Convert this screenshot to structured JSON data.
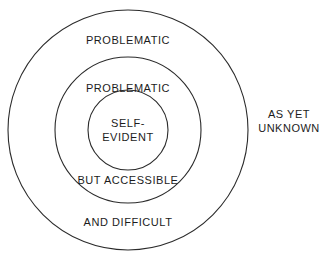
{
  "diagram": {
    "type": "concentric-circles",
    "background_color": "#ffffff",
    "stroke_color": "#2b2b2b",
    "text_color": "#1c1c1c",
    "canvas": {
      "width": 324,
      "height": 273
    },
    "circles": [
      {
        "name": "outer-circle",
        "cx": 128,
        "cy": 130,
        "r": 120
      },
      {
        "name": "middle-circle",
        "cx": 128,
        "cy": 130,
        "r": 73
      },
      {
        "name": "inner-circle",
        "cx": 128,
        "cy": 130,
        "r": 40
      }
    ],
    "labels": {
      "outer_top": "PROBLEMATIC",
      "outer_bottom": "AND DIFFICULT",
      "middle_top": "PROBLEMATIC",
      "middle_bottom": "BUT ACCESSIBLE",
      "core_line1": "SELF-",
      "core_line2": "EVIDENT",
      "outside_line1": "AS YET",
      "outside_line2": "UNKNOWN"
    }
  }
}
